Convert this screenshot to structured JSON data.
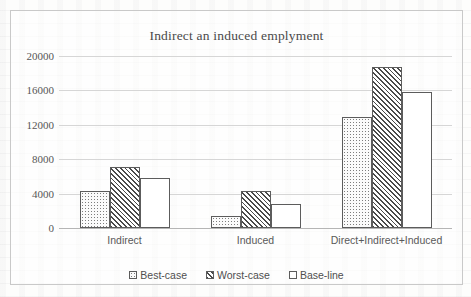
{
  "chart_data": {
    "type": "bar",
    "title": "Indirect an induced emplyment",
    "xlabel": "",
    "ylabel": "",
    "ylim": [
      0,
      20000
    ],
    "yticks": [
      0,
      4000,
      8000,
      12000,
      16000,
      20000
    ],
    "ytick_labels": [
      "0",
      "4000",
      "8000",
      "12000",
      "16000",
      "20000"
    ],
    "grid": true,
    "legend_position": "bottom",
    "categories": [
      "Indirect",
      "Induced",
      "Direct+Indirect+Induced"
    ],
    "series": [
      {
        "name": "Best-case",
        "pattern": "dots",
        "values": [
          4300,
          1400,
          12900
        ]
      },
      {
        "name": "Worst-case",
        "pattern": "hatch",
        "values": [
          7100,
          4250,
          18700
        ]
      },
      {
        "name": "Base-line",
        "pattern": "blank",
        "values": [
          5800,
          2800,
          15850
        ]
      }
    ]
  },
  "colors": {
    "frame_border": "#c9c9c9",
    "gridline": "#d6d6d6",
    "axis": "#b5b5b5",
    "bar_outline": "#5c5c5c",
    "text": "#4f4f4f"
  }
}
